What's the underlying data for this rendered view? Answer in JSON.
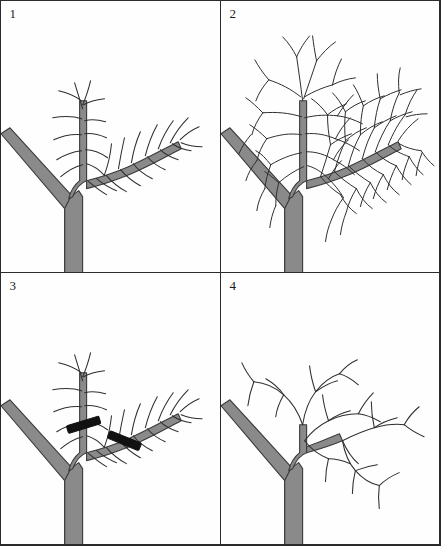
{
  "figure": {
    "panel_count": 4,
    "background_color": "#fefefe",
    "border_color": "#2b2b2b",
    "branch_fill_color": "#8a8a8a",
    "branch_outline_color": "#3a3a3a",
    "twig_color": "#2e2e2e",
    "cut_mark_color": "#111111"
  },
  "panels": [
    {
      "number": "1",
      "caption": "Young branch with central leader and one lateral limb, fine twigs",
      "stage": "before-growth",
      "cut_marks": 0
    },
    {
      "number": "2",
      "caption": "Same branch after a season of dense twiggy growth",
      "stage": "overgrown",
      "cut_marks": 0
    },
    {
      "number": "3",
      "caption": "Pruning cuts marked on the leader and the lateral limb",
      "stage": "marked-for-cut",
      "cut_marks": 2
    },
    {
      "number": "4",
      "caption": "Branch reduced to short stubs after the cuts are made",
      "stage": "after-pruning",
      "cut_marks": 0
    }
  ]
}
